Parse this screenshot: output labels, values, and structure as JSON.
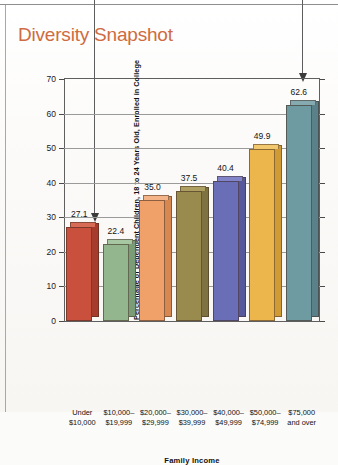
{
  "page": {
    "title": "Diversity Snapshot",
    "title_color": "#cf6b42"
  },
  "chart_data": {
    "type": "bar",
    "title": "Diversity Snapshot",
    "xlabel": "Family Income",
    "ylabel": "Percentage of Dependent Children, 18 to 24 Years Old, Enrolled in College",
    "ylim": [
      0,
      70
    ],
    "yticks": [
      0,
      10,
      20,
      30,
      40,
      50,
      60,
      70
    ],
    "grid": true,
    "legend": null,
    "categories": [
      "Under $10,000",
      "$10,000–$19,999",
      "$20,000–$29,999",
      "$30,000–$39,999",
      "$40,000–$49,999",
      "$50,000–$74,999",
      "$75,000 and over"
    ],
    "category_lines": [
      [
        "Under",
        "$10,000"
      ],
      [
        "$10,000–",
        "$19,999"
      ],
      [
        "$20,000–",
        "$29,999"
      ],
      [
        "$30,000–",
        "$39,999"
      ],
      [
        "$40,000–",
        "$49,999"
      ],
      [
        "$50,000–",
        "$74,999"
      ],
      [
        "$75,000",
        "and over"
      ]
    ],
    "values": [
      27.1,
      22.4,
      35.0,
      37.5,
      40.4,
      49.9,
      62.6
    ],
    "value_labels": [
      "27.1",
      "22.4",
      "35.0",
      "37.5",
      "40.4",
      "49.9",
      "62.6"
    ],
    "bar_colors": [
      "#c8503c",
      "#93b68f",
      "#f0a16a",
      "#998b4e",
      "#6a6eb6",
      "#edb64d",
      "#6e9aa1"
    ],
    "bar_side_colors": [
      "#a63c2c",
      "#7a9d77",
      "#d78851",
      "#7e7340",
      "#55589b",
      "#d09a35",
      "#5a8189"
    ],
    "bar_top_colors": [
      "#d86b55",
      "#a6c7a2",
      "#f4b488",
      "#ad9f61",
      "#8184c8",
      "#f2c76e",
      "#85aab0"
    ],
    "ytick_labels": [
      "0",
      "10",
      "20",
      "30",
      "40",
      "50",
      "60",
      "70"
    ]
  },
  "annotations": [
    {
      "name": "leader-line-lowest",
      "target_value": "27.1"
    },
    {
      "name": "leader-line-highest",
      "target_value": "62.6"
    }
  ]
}
